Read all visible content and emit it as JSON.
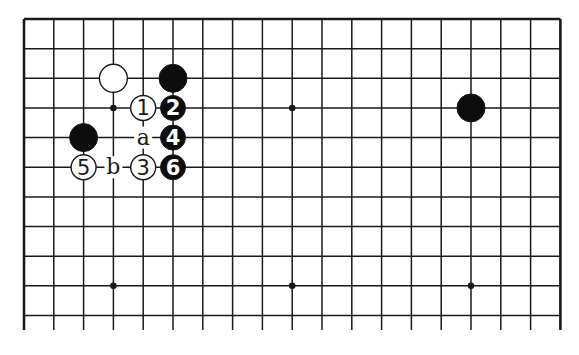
{
  "diagram": {
    "type": "go-board-fragment",
    "grid": {
      "columns": 19,
      "visible_rows": 11,
      "origin_x": 24,
      "origin_y": 19,
      "spacing_x": 29.8,
      "spacing_y": 29.65,
      "line_bottom_extend_y": 330,
      "edges": {
        "top": true,
        "left": true,
        "right": true,
        "bottom": false
      }
    },
    "star_points": [
      {
        "col": 3,
        "row": 3
      },
      {
        "col": 9,
        "row": 3
      },
      {
        "col": 3,
        "row": 9
      },
      {
        "col": 9,
        "row": 9
      },
      {
        "col": 15,
        "row": 9
      }
    ],
    "stones": [
      {
        "color": "white",
        "col": 3,
        "row": 2,
        "label": ""
      },
      {
        "color": "black",
        "col": 5,
        "row": 2,
        "label": ""
      },
      {
        "color": "black",
        "col": 15,
        "row": 3,
        "label": ""
      },
      {
        "color": "black",
        "col": 2,
        "row": 4,
        "label": ""
      },
      {
        "color": "white",
        "col": 4,
        "row": 3,
        "label": "1"
      },
      {
        "color": "black",
        "col": 5,
        "row": 3,
        "label": "2"
      },
      {
        "color": "white",
        "col": 4,
        "row": 5,
        "label": "3"
      },
      {
        "color": "black",
        "col": 5,
        "row": 4,
        "label": "4"
      },
      {
        "color": "white",
        "col": 2,
        "row": 5,
        "label": "5"
      },
      {
        "color": "black",
        "col": 5,
        "row": 5,
        "label": "6"
      }
    ],
    "markers": [
      {
        "col": 4,
        "row": 4,
        "label": "a"
      },
      {
        "col": 3,
        "row": 5,
        "label": "b"
      }
    ],
    "colors": {
      "line": "#1a1a1a",
      "black_stone": "#0d0d0d",
      "white_stone": "#ffffff",
      "background": "#ffffff"
    }
  }
}
